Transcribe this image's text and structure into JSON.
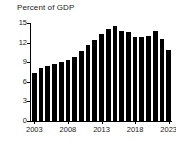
{
  "chart_data": {
    "type": "bar",
    "title": "Percent of GDP",
    "subtitle": "",
    "xlabel": "",
    "ylabel": "",
    "ylim": [
      0,
      15
    ],
    "xlim": [
      2002.5,
      2023.5
    ],
    "grid": false,
    "legend": null,
    "bar_color": "#000000",
    "axis_color": "#000000",
    "text_color": "#1a1a1a",
    "background": "#ffffff",
    "ytick_values": [
      0,
      3,
      6,
      9,
      12,
      15
    ],
    "ytick_labels": [
      "0",
      "3",
      "6",
      "9",
      "12",
      "15"
    ],
    "xtick_values": [
      2003,
      2008,
      2013,
      2018,
      2023
    ],
    "xtick_labels": [
      "2003",
      "2008",
      "2013",
      "2018",
      "2023"
    ],
    "categories": [
      "2003",
      "2004",
      "2005",
      "2006",
      "2007",
      "2008",
      "2009",
      "2010",
      "2011",
      "2012",
      "2013",
      "2014",
      "2015",
      "2016",
      "2017",
      "2018",
      "2019",
      "2020",
      "2021",
      "2022",
      "2023"
    ],
    "values": [
      7.3,
      8.1,
      8.4,
      8.8,
      9.1,
      9.4,
      9.8,
      10.7,
      11.7,
      12.4,
      13.3,
      14.1,
      14.6,
      13.8,
      13.6,
      12.9,
      12.8,
      13.0,
      13.8,
      12.6,
      10.9
    ],
    "last_value_note": 8.6
  }
}
